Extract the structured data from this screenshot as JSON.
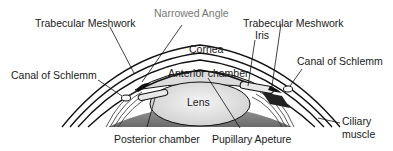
{
  "diagram": {
    "type": "anatomical-cross-section",
    "labels": {
      "trabecular_meshwork_left": "Trabecular Meshwork",
      "narrowed_angle": "Narrowed Angle",
      "trabecular_meshwork_right": "Trabecular Meshwork",
      "iris": "Iris",
      "cornea": "Cornea",
      "anterior_chamber": "Anterior chamber",
      "canal_of_schlemm_left": "Canal of Schlemm",
      "canal_of_schlemm_right": "Canal of Schlemm",
      "lens": "Lens",
      "ciliary_muscle_line1": "Ciliary",
      "ciliary_muscle_line2": "muscle",
      "posterior_chamber": "Posterior chamber",
      "pupillary_aperture": "Pupillary Apeture"
    },
    "colors": {
      "line": "#111111",
      "narrowed_angle_label": "#777777",
      "lens_fill": "#e6e6e6",
      "anterior_chamber_fill": "#d9d9d9",
      "ciliary_fill": "#555555"
    }
  }
}
